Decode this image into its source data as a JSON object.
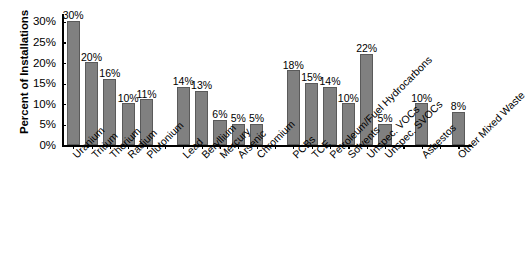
{
  "chart_data": {
    "type": "bar",
    "title": "",
    "subtitle": "",
    "xlabel": "",
    "ylabel": "Percent of Installations",
    "ylim": [
      0,
      32
    ],
    "grid": false,
    "legend": false,
    "value_label_suffix": "%",
    "ytick_labels": [
      "0%",
      "5%",
      "10%",
      "15%",
      "20%",
      "25%",
      "30%"
    ],
    "ytick_values": [
      0,
      5,
      10,
      15,
      20,
      25,
      30
    ],
    "categories": [
      "Uranium",
      "Tritium",
      "Thorium",
      "Radium",
      "Plutonium",
      "Lead",
      "Beryllium",
      "Mercury",
      "Arsenic",
      "Chromium",
      "PCBs",
      "TCE",
      "Petroleum/Fuel Hydrocarbons",
      "Solvents",
      "Unspec. VOCs",
      "Unspec. SVOCs",
      "Asbestos",
      "Other Mixed Waste"
    ],
    "values": [
      30,
      20,
      16,
      10,
      11,
      14,
      13,
      6,
      5,
      5,
      18,
      15,
      14,
      10,
      22,
      5,
      10,
      8
    ],
    "value_labels": [
      "30%",
      "20%",
      "16%",
      "10%",
      "11%",
      "14%",
      "13%",
      "6%",
      "5%",
      "5%",
      "18%",
      "15%",
      "14%",
      "10%",
      "22%",
      "5%",
      "10%",
      "8%"
    ],
    "groups": [
      {
        "name": "radionuclides",
        "start": 0,
        "count": 5
      },
      {
        "name": "metals",
        "start": 5,
        "count": 5
      },
      {
        "name": "organics",
        "start": 10,
        "count": 6
      },
      {
        "name": "asbestos",
        "start": 16,
        "count": 1
      },
      {
        "name": "other",
        "start": 17,
        "count": 1
      }
    ],
    "colors": {
      "bar_fill": "#808080",
      "bar_stroke": "#5a5a5a",
      "axis": "#000000",
      "text": "#000000",
      "background": "#ffffff"
    }
  }
}
